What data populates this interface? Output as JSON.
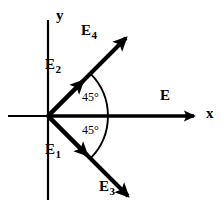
{
  "figure": {
    "background_color": "#ffffff",
    "stroke_color": "#000000"
  },
  "axes": {
    "x_label": "x",
    "y_label": "y",
    "origin": {
      "x": 48,
      "y": 116
    },
    "x_axis": {
      "start_x": 8,
      "end_x": 200,
      "y": 116,
      "has_arrow": true
    },
    "y_axis": {
      "x": 48,
      "start_y": 20,
      "end_y": 200,
      "has_arrow": false
    }
  },
  "vectors": [
    {
      "name": "E2",
      "label": "E",
      "subscript": "2",
      "angle_deg": 45,
      "length_px": 57,
      "tip": {
        "x": 88,
        "y": 76
      },
      "description": "short upper vector at 45 degrees"
    },
    {
      "name": "E4",
      "label": "E",
      "subscript": "4",
      "angle_deg": 45,
      "length_px": 117,
      "tip": {
        "x": 131,
        "y": 33
      },
      "description": "long upper vector at 45 degrees"
    },
    {
      "name": "E1",
      "label": "E",
      "subscript": "1",
      "angle_deg": -45,
      "length_px": 62,
      "tip": {
        "x": 92,
        "y": 160
      },
      "description": "short lower vector at minus 45 degrees"
    },
    {
      "name": "E3",
      "label": "E",
      "subscript": "3",
      "angle_deg": -45,
      "length_px": 120,
      "tip": {
        "x": 133,
        "y": 201
      },
      "description": "long lower vector at minus 45 degrees"
    },
    {
      "name": "E",
      "label": "E",
      "subscript": "",
      "angle_deg": 0,
      "length_px": 152,
      "tip": {
        "x": 200,
        "y": 116
      },
      "description": "resultant vector along positive x axis"
    }
  ],
  "angles": [
    {
      "name": "angle-top",
      "value": "45°",
      "between": [
        "E4",
        "E"
      ],
      "position": {
        "x": 82,
        "y": 91
      }
    },
    {
      "name": "angle-bottom",
      "value": "45°",
      "between": [
        "E",
        "E3"
      ],
      "position": {
        "x": 82,
        "y": 124
      }
    }
  ],
  "arc": {
    "name": "angle-arc",
    "radius_px": 60,
    "start_angle_deg": 45,
    "end_angle_deg": -45,
    "center": {
      "x": 48,
      "y": 116
    }
  }
}
